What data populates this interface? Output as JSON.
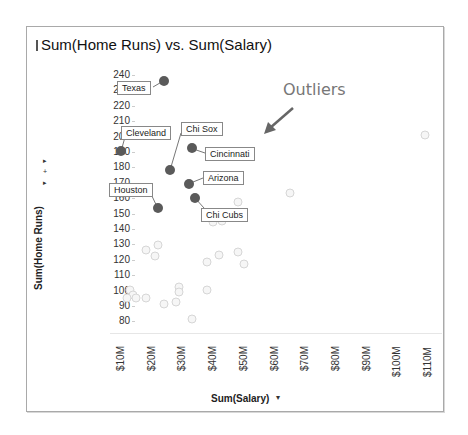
{
  "chart_data": {
    "type": "scatter",
    "title": "Sum(Home Runs) vs. Sum(Salary)",
    "xlabel": "Sum(Salary)",
    "ylabel": "Sum(Home Runs)",
    "x_ticks": [
      "$10M",
      "$20M",
      "$30M",
      "$40M",
      "$50M",
      "$60M",
      "$70M",
      "$80M",
      "$90M",
      "$100M",
      "$110M"
    ],
    "y_ticks": [
      "240",
      "230",
      "220",
      "210",
      "200",
      "190",
      "180",
      "170",
      "160",
      "150",
      "140",
      "130",
      "120",
      "110",
      "100",
      "90",
      "80"
    ],
    "xlim": [
      10,
      110
    ],
    "ylim": [
      80,
      240
    ],
    "grid": false,
    "annotation": "Outliers",
    "highlighted_points": [
      {
        "label": "Texas",
        "x": 24,
        "y": 237
      },
      {
        "label": "Cleveland",
        "x": 10,
        "y": 191
      },
      {
        "label": "Chi Sox",
        "x": 26,
        "y": 179
      },
      {
        "label": "Cincinnati",
        "x": 33,
        "y": 193
      },
      {
        "label": "Arizona",
        "x": 32,
        "y": 170
      },
      {
        "label": "Chi Cubs",
        "x": 34,
        "y": 161
      },
      {
        "label": "Houston",
        "x": 22,
        "y": 154
      }
    ],
    "other_points": [
      {
        "x": 109,
        "y": 202
      },
      {
        "x": 65,
        "y": 164
      },
      {
        "x": 48,
        "y": 158
      },
      {
        "x": 40,
        "y": 145
      },
      {
        "x": 43,
        "y": 146
      },
      {
        "x": 18,
        "y": 127
      },
      {
        "x": 22,
        "y": 130
      },
      {
        "x": 21,
        "y": 123
      },
      {
        "x": 48,
        "y": 126
      },
      {
        "x": 50,
        "y": 118
      },
      {
        "x": 38,
        "y": 119
      },
      {
        "x": 42,
        "y": 124
      },
      {
        "x": 13,
        "y": 101
      },
      {
        "x": 14,
        "y": 98
      },
      {
        "x": 12,
        "y": 96
      },
      {
        "x": 15,
        "y": 96
      },
      {
        "x": 18,
        "y": 96
      },
      {
        "x": 24,
        "y": 92
      },
      {
        "x": 28,
        "y": 93
      },
      {
        "x": 29,
        "y": 103
      },
      {
        "x": 29,
        "y": 100
      },
      {
        "x": 38,
        "y": 101
      },
      {
        "x": 33,
        "y": 82
      }
    ]
  },
  "ui": {
    "title": "Sum(Home Runs) vs. Sum(Salary)",
    "x_axis_label": "Sum(Salary)",
    "y_axis_label": "Sum(Home Runs)",
    "x_axis_menu_icon": "▾",
    "annotation": "Outliers",
    "side_controls": [
      "▸",
      "+",
      "▸"
    ]
  }
}
